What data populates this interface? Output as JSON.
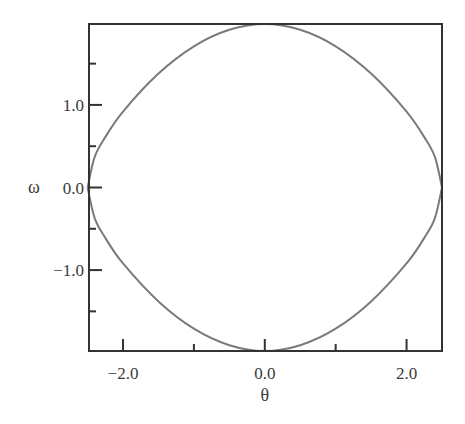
{
  "chart_data": {
    "type": "line",
    "title": "",
    "xlabel": "θ",
    "ylabel": "ω",
    "xlim": [
      -2.48,
      2.5
    ],
    "ylim": [
      -1.98,
      1.98
    ],
    "grid": false,
    "legend": null,
    "x_ticks": [
      {
        "value": -2.0,
        "label": "−2.0"
      },
      {
        "value": 0.0,
        "label": "0.0"
      },
      {
        "value": 2.0,
        "label": "2.0"
      }
    ],
    "x_minor_ticks": [
      -1.0,
      1.0
    ],
    "y_ticks": [
      {
        "value": 1.0,
        "label": "1.0"
      },
      {
        "value": 0.0,
        "label": "0.0"
      },
      {
        "value": -1.0,
        "label": "−1.0"
      }
    ],
    "y_minor_ticks": [
      1.5,
      0.5,
      -0.5,
      -1.5
    ],
    "series": [
      {
        "name": "phase orbit (upper branch)",
        "color": "#7a7a7a",
        "x": [
          -2.5,
          -2.4,
          -2.25,
          -2.0,
          -1.5,
          -1.0,
          -0.5,
          0.0,
          0.5,
          1.0,
          1.5,
          2.0,
          2.25,
          2.4,
          2.5
        ],
        "y": [
          0.0,
          0.37,
          0.61,
          0.92,
          1.38,
          1.71,
          1.91,
          1.98,
          1.91,
          1.71,
          1.38,
          0.92,
          0.61,
          0.37,
          0.0
        ]
      },
      {
        "name": "phase orbit (lower branch)",
        "color": "#7a7a7a",
        "x": [
          -2.5,
          -2.4,
          -2.25,
          -2.0,
          -1.5,
          -1.0,
          -0.5,
          0.0,
          0.5,
          1.0,
          1.5,
          2.0,
          2.25,
          2.4,
          2.5
        ],
        "y": [
          0.0,
          -0.37,
          -0.61,
          -0.92,
          -1.38,
          -1.71,
          -1.91,
          -1.98,
          -1.91,
          -1.71,
          -1.38,
          -0.92,
          -0.61,
          -0.37,
          0.0
        ]
      }
    ]
  },
  "layout": {
    "plot_left": 89,
    "plot_right": 442,
    "plot_top": 24,
    "plot_bottom": 351
  }
}
